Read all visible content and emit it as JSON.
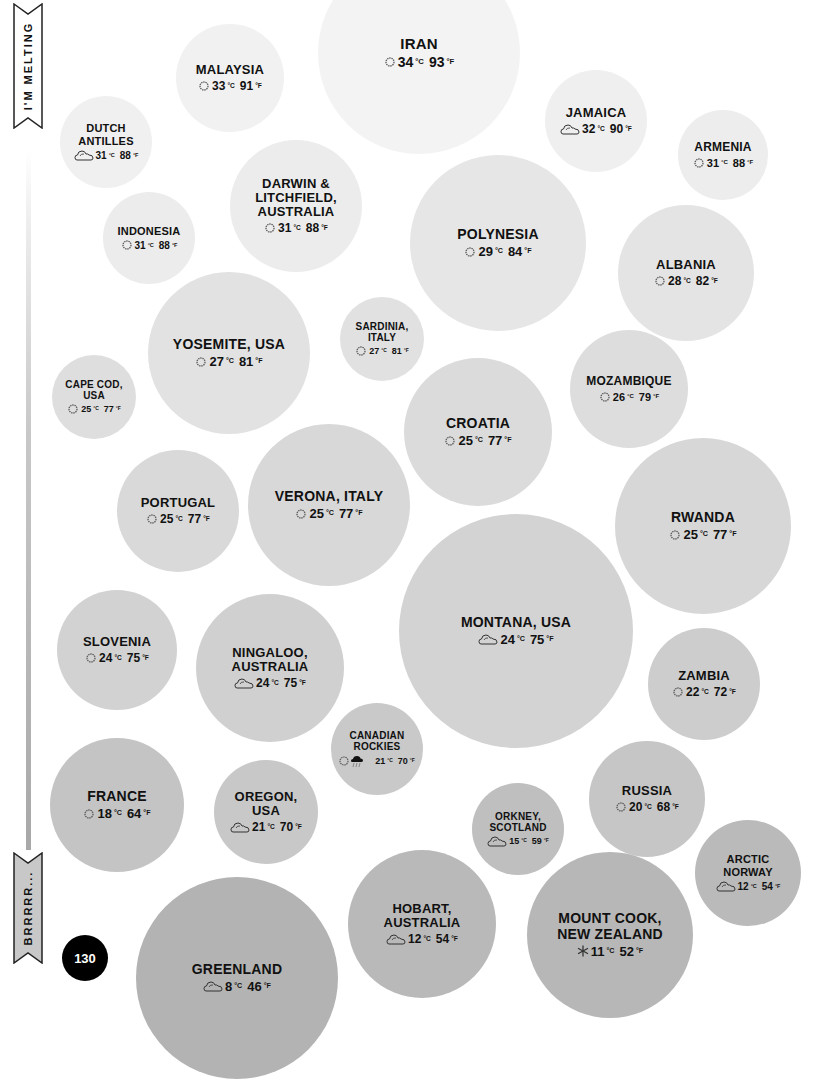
{
  "scale": {
    "top_label": "I'M MELTING",
    "bottom_label": "BRRRRR...",
    "bar_color_top": "#ffffff",
    "bar_color_bottom": "#a8a8a8"
  },
  "page_number": "130",
  "units": {
    "celsius": "°C",
    "fahrenheit": "°F"
  },
  "icons": {
    "sunny": "sun-icon",
    "partly_cloudy": "cloud-sun-icon",
    "storm_sun": "sun-and-storm-cloud-icon",
    "snow": "snowflake-icon"
  },
  "bubbles": [
    {
      "name": "IRAN",
      "c": "34",
      "f": "93",
      "icon": "sunny",
      "x": 318,
      "y": -48,
      "d": 202,
      "color": "#f3f3f3",
      "fs": 15
    },
    {
      "name": "MALAYSIA",
      "c": "33",
      "f": "91",
      "icon": "sunny",
      "x": 176,
      "y": 24,
      "d": 108,
      "color": "#f1f1f1",
      "fs": 13
    },
    {
      "name": "DUTCH ANTILLES",
      "c": "31",
      "f": "88",
      "icon": "partly_cloudy",
      "x": 60,
      "y": 96,
      "d": 92,
      "color": "#f0f0f0",
      "fs": 11
    },
    {
      "name": "JAMAICA",
      "c": "32",
      "f": "90",
      "icon": "partly_cloudy",
      "x": 545,
      "y": 70,
      "d": 102,
      "color": "#efefef",
      "fs": 13
    },
    {
      "name": "ARMENIA",
      "c": "31",
      "f": "88",
      "icon": "sunny",
      "x": 678,
      "y": 110,
      "d": 90,
      "color": "#ededed",
      "fs": 12
    },
    {
      "name": "DARWIN & LITCHFIELD, AUSTRALIA",
      "c": "31",
      "f": "88",
      "icon": "sunny",
      "x": 230,
      "y": 140,
      "d": 132,
      "color": "#ececec",
      "fs": 13
    },
    {
      "name": "INDONESIA",
      "c": "31",
      "f": "88",
      "icon": "sunny",
      "x": 103,
      "y": 192,
      "d": 92,
      "color": "#ececec",
      "fs": 11
    },
    {
      "name": "POLYNESIA",
      "c": "29",
      "f": "84",
      "icon": "sunny",
      "x": 410,
      "y": 155,
      "d": 176,
      "color": "#e6e6e6",
      "fs": 14
    },
    {
      "name": "ALBANIA",
      "c": "28",
      "f": "82",
      "icon": "sunny",
      "x": 618,
      "y": 205,
      "d": 136,
      "color": "#e4e4e4",
      "fs": 13
    },
    {
      "name": "YOSEMITE, USA",
      "c": "27",
      "f": "81",
      "icon": "sunny",
      "x": 148,
      "y": 272,
      "d": 162,
      "color": "#e2e2e2",
      "fs": 14
    },
    {
      "name": "SARDINIA, ITALY",
      "c": "27",
      "f": "81",
      "icon": "sunny",
      "x": 340,
      "y": 297,
      "d": 84,
      "color": "#e1e1e1",
      "fs": 10
    },
    {
      "name": "CAPE COD, USA",
      "c": "25",
      "f": "77",
      "icon": "sunny",
      "x": 52,
      "y": 355,
      "d": 84,
      "color": "#dedede",
      "fs": 10
    },
    {
      "name": "MOZAMBIQUE",
      "c": "26",
      "f": "79",
      "icon": "sunny",
      "x": 570,
      "y": 330,
      "d": 118,
      "color": "#dddddd",
      "fs": 12
    },
    {
      "name": "CROATIA",
      "c": "25",
      "f": "77",
      "icon": "sunny",
      "x": 404,
      "y": 358,
      "d": 148,
      "color": "#dbdbdb",
      "fs": 14
    },
    {
      "name": "PORTUGAL",
      "c": "25",
      "f": "77",
      "icon": "sunny",
      "x": 117,
      "y": 450,
      "d": 122,
      "color": "#d9d9d9",
      "fs": 13
    },
    {
      "name": "VERONA, ITALY",
      "c": "25",
      "f": "77",
      "icon": "sunny",
      "x": 248,
      "y": 424,
      "d": 162,
      "color": "#d8d8d8",
      "fs": 14
    },
    {
      "name": "RWANDA",
      "c": "25",
      "f": "77",
      "icon": "sunny",
      "x": 615,
      "y": 438,
      "d": 176,
      "color": "#d7d7d7",
      "fs": 14
    },
    {
      "name": "MONTANA, USA",
      "c": "24",
      "f": "75",
      "icon": "partly_cloudy",
      "x": 399,
      "y": 514,
      "d": 234,
      "color": "#d3d3d3",
      "fs": 14
    },
    {
      "name": "SLOVENIA",
      "c": "24",
      "f": "75",
      "icon": "sunny",
      "x": 57,
      "y": 590,
      "d": 120,
      "color": "#d2d2d2",
      "fs": 13
    },
    {
      "name": "NINGALOO, AUSTRALIA",
      "c": "24",
      "f": "75",
      "icon": "partly_cloudy",
      "x": 196,
      "y": 594,
      "d": 148,
      "color": "#d0d0d0",
      "fs": 13
    },
    {
      "name": "ZAMBIA",
      "c": "22",
      "f": "72",
      "icon": "sunny",
      "x": 648,
      "y": 628,
      "d": 112,
      "color": "#cdcdcd",
      "fs": 13
    },
    {
      "name": "CANADIAN ROCKIES",
      "c": "21",
      "f": "70",
      "icon": "storm_sun",
      "x": 331,
      "y": 703,
      "d": 92,
      "color": "#c9c9c9",
      "fs": 10
    },
    {
      "name": "FRANCE",
      "c": "18",
      "f": "64",
      "icon": "sunny",
      "x": 50,
      "y": 738,
      "d": 134,
      "color": "#c4c4c4",
      "fs": 14
    },
    {
      "name": "OREGON, USA",
      "c": "21",
      "f": "70",
      "icon": "partly_cloudy",
      "x": 214,
      "y": 760,
      "d": 104,
      "color": "#c8c8c8",
      "fs": 13
    },
    {
      "name": "RUSSIA",
      "c": "20",
      "f": "68",
      "icon": "sunny",
      "x": 589,
      "y": 741,
      "d": 116,
      "color": "#c6c6c6",
      "fs": 13
    },
    {
      "name": "ORKNEY, SCOTLAND",
      "c": "15",
      "f": "59",
      "icon": "partly_cloudy",
      "x": 472,
      "y": 783,
      "d": 92,
      "color": "#bfbfbf",
      "fs": 10
    },
    {
      "name": "ARCTIC NORWAY",
      "c": "12",
      "f": "54",
      "icon": "partly_cloudy",
      "x": 695,
      "y": 820,
      "d": 106,
      "color": "#bababa",
      "fs": 11
    },
    {
      "name": "HOBART, AUSTRALIA",
      "c": "12",
      "f": "54",
      "icon": "partly_cloudy",
      "x": 348,
      "y": 850,
      "d": 148,
      "color": "#b9b9b9",
      "fs": 13
    },
    {
      "name": "MOUNT COOK, NEW ZEALAND",
      "c": "11",
      "f": "52",
      "icon": "snow",
      "x": 527,
      "y": 852,
      "d": 166,
      "color": "#b7b7b7",
      "fs": 14
    },
    {
      "name": "GREENLAND",
      "c": "8",
      "f": "46",
      "icon": "partly_cloudy",
      "x": 136,
      "y": 877,
      "d": 202,
      "color": "#b3b3b3",
      "fs": 14
    }
  ]
}
